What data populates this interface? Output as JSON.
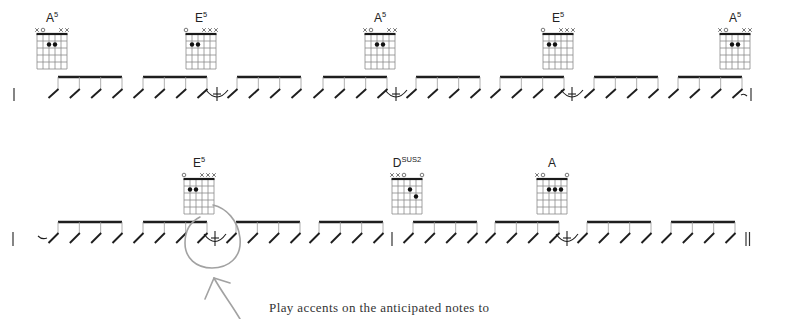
{
  "chords": {
    "A5": {
      "label": "A",
      "sup": "5",
      "markers": [
        "x",
        "o",
        "",
        "",
        "x",
        "x"
      ],
      "dots": [
        [
          3,
          2
        ],
        [
          4,
          2
        ]
      ]
    },
    "E5": {
      "label": "E",
      "sup": "5",
      "markers": [
        "o",
        "",
        "",
        "x",
        "x",
        "x"
      ],
      "dots": [
        [
          2,
          2
        ],
        [
          3,
          2
        ]
      ]
    },
    "Dsus2": {
      "label": "D",
      "sup": "sus2",
      "markers": [
        "x",
        "x",
        "o",
        "",
        "",
        "o"
      ],
      "dots": [
        [
          4,
          2
        ],
        [
          5,
          3
        ]
      ]
    },
    "A": {
      "label": "A",
      "sup": "",
      "markers": [
        "x",
        "o",
        "",
        "",
        "",
        "o"
      ],
      "dots": [
        [
          3,
          2
        ],
        [
          4,
          2
        ],
        [
          5,
          2
        ]
      ]
    }
  },
  "systems": [
    {
      "chord_sequence": [
        "A5",
        "E5",
        "A5",
        "E5",
        "A5"
      ],
      "beam_groups": 8,
      "slashes_per_group": 4,
      "anticipations_after_group": [
        2,
        4,
        6
      ],
      "start": "barline",
      "end": "tie-into-barline"
    },
    {
      "chord_sequence": [
        "E5",
        "Dsus2",
        "A"
      ],
      "beam_groups": 8,
      "slashes_per_group": 4,
      "anticipations_after_group": [
        2,
        6
      ],
      "inner_barline_after_group": 4,
      "start": "barline-tie",
      "end": "double-barline",
      "highlight": "circled-anticipation"
    }
  ],
  "annotation": {
    "caption": "Play accents on the anticipated notes to",
    "highlight_color": "#a2a2a2"
  }
}
